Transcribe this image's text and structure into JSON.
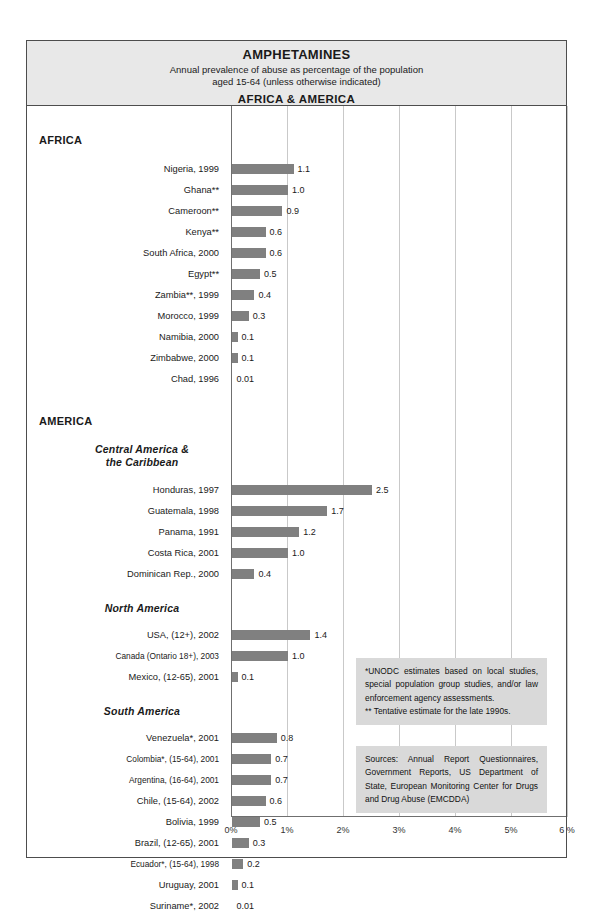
{
  "header": {
    "title": "AMPHETAMINES",
    "subtitle_line1": "Annual prevalence of abuse as percentage of the population",
    "subtitle_line2": "aged 15-64 (unless otherwise indicated)",
    "region_title": "AFRICA &  AMERICA"
  },
  "notes": {
    "estimates_line1": "*UNODC estimates based on local studies, special population group studies, and/or law enforcement  agency assessments.",
    "estimates_line2": "** Tentative estimate for the late 1990s.",
    "sources": "Sources: Annual Report Questionnaires, Government Reports, US Department of State, European Monitoring Center for Drugs and Drug Abuse (EMCDDA)"
  },
  "chart_data": {
    "type": "bar",
    "orientation": "horizontal",
    "title": "AMPHETAMINES",
    "subtitle": "Annual prevalence of abuse as percentage of the population aged 15-64 (unless otherwise indicated)",
    "xlabel": "",
    "ylabel": "",
    "xlim": [
      0,
      6
    ],
    "xticks": [
      0,
      1,
      2,
      3,
      4,
      5,
      6
    ],
    "xtick_labels": [
      "0%",
      "1%",
      "2%",
      "3%",
      "4%",
      "5%",
      "6 %"
    ],
    "grid": true,
    "legend": "none",
    "bar_color": "#808080",
    "groups": [
      {
        "name": "AFRICA",
        "type": "group",
        "subgroups": [
          {
            "name": "",
            "categories": [
              "Nigeria, 1999",
              "Ghana**",
              "Cameroon**",
              "Kenya**",
              "South Africa, 2000",
              "Egypt**",
              "Zambia**, 1999",
              "Morocco, 1999",
              "Namibia, 2000",
              "Zimbabwe, 2000",
              "Chad, 1996"
            ],
            "values": [
              1.1,
              1.0,
              0.9,
              0.6,
              0.6,
              0.5,
              0.4,
              0.3,
              0.1,
              0.1,
              0.01
            ],
            "value_labels": [
              "1.1",
              "1.0",
              "0.9",
              "0.6",
              "0.6",
              "0.5",
              "0.4",
              "0.3",
              "0.1",
              "0.1",
              "0.01"
            ]
          }
        ]
      },
      {
        "name": "AMERICA",
        "type": "group",
        "subgroups": [
          {
            "name": "Central America & the Caribbean",
            "name_line1": "Central America &",
            "name_line2": "the Caribbean",
            "categories": [
              "Honduras, 1997",
              "Guatemala, 1998",
              "Panama, 1991",
              "Costa Rica,  2001",
              "Dominican Rep., 2000"
            ],
            "values": [
              2.5,
              1.7,
              1.2,
              1.0,
              0.4
            ],
            "value_labels": [
              "2.5",
              "1.7",
              "1.2",
              "1.0",
              "0.4"
            ]
          },
          {
            "name": "North America",
            "categories": [
              "USA, (12+), 2002",
              "Canada (Ontario 18+), 2003",
              "Mexico, (12-65), 2001"
            ],
            "values": [
              1.4,
              1.0,
              0.1
            ],
            "value_labels": [
              "1.4",
              "1.0",
              "0.1"
            ]
          },
          {
            "name": "South America",
            "categories": [
              "Venezuela*, 2001",
              "Colombia*, (15-64), 2001",
              "Argentina, (16-64), 2001",
              "Chile, (15-64), 2002",
              "Bolivia, 1999",
              "Brazil, (12-65), 2001",
              "Ecuador*, (15-64), 1998",
              "Uruguay, 2001",
              "Suriname*, 2002"
            ],
            "values": [
              0.8,
              0.7,
              0.7,
              0.6,
              0.5,
              0.3,
              0.2,
              0.1,
              0.01
            ],
            "value_labels": [
              "0.8",
              "0.7",
              "0.7",
              "0.6",
              "0.5",
              "0.3",
              "0.2",
              "0.1",
              "0.01"
            ]
          }
        ]
      }
    ]
  }
}
